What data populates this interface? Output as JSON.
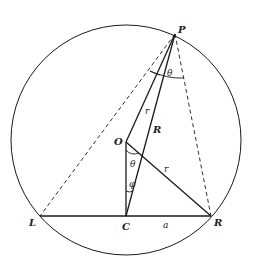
{
  "diagram": {
    "circle": {
      "cx": 126,
      "cy": 140,
      "r": 115
    },
    "points": {
      "P": {
        "label": "P",
        "x": 175,
        "y": 34
      },
      "O": {
        "label": "O",
        "x": 126,
        "y": 142
      },
      "C": {
        "label": "C",
        "x": 126,
        "y": 216
      },
      "L": {
        "label": "L",
        "x": 40,
        "y": 216
      },
      "R": {
        "label": "R",
        "x": 211,
        "y": 216
      }
    },
    "segment_labels": {
      "r_upper": "r",
      "R_long": "R",
      "r_lower": "r",
      "a": "a"
    },
    "angle_labels": {
      "theta_top": "θ",
      "theta_O": "θ",
      "phi_C": "φ"
    },
    "colors": {
      "stroke": "#1a1a1a",
      "background": "#ffffff"
    }
  }
}
